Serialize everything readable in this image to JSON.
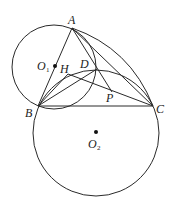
{
  "diagram": {
    "type": "geometry",
    "colors": {
      "stroke": "#2a2a2a",
      "background": "#ffffff"
    },
    "points": {
      "A": {
        "label": "A",
        "x": 72,
        "y": 28
      },
      "B": {
        "label": "B",
        "x": 38,
        "y": 106
      },
      "C": {
        "label": "C",
        "x": 153,
        "y": 106
      },
      "D": {
        "label": "D",
        "x": 97,
        "y": 69
      },
      "H": {
        "label": "H",
        "x": 68,
        "y": 74
      },
      "P": {
        "label": "P",
        "x": 112,
        "y": 92
      },
      "O1": {
        "label": "O",
        "sub": "1",
        "x": 55,
        "y": 66
      },
      "O2": {
        "label": "O",
        "sub": "2",
        "x": 96,
        "y": 132
      }
    },
    "circles": [
      {
        "name": "O1",
        "cx": 54,
        "cy": 67,
        "r": 42
      },
      {
        "name": "O2",
        "cx": 96,
        "cy": 133,
        "r": 63
      }
    ],
    "segments": [
      [
        "A",
        "B"
      ],
      [
        "A",
        "C"
      ],
      [
        "B",
        "C"
      ],
      [
        "A",
        "P"
      ],
      [
        "H",
        "C"
      ],
      [
        "B",
        "D"
      ],
      [
        "B",
        "H"
      ]
    ],
    "arcs": [
      {
        "name": "arc-A-C",
        "from": "A",
        "to": "C"
      }
    ]
  }
}
